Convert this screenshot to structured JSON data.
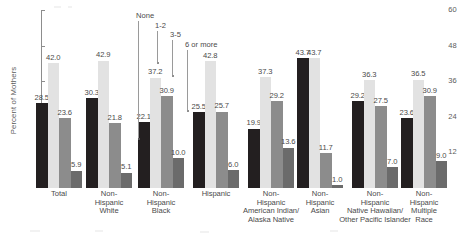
{
  "chart_data": {
    "type": "bar",
    "title": "",
    "xlabel": "",
    "ylabel": "Percent of Mothers",
    "ylim": [
      0,
      60
    ],
    "yticks": [
      12,
      24,
      36,
      48,
      60
    ],
    "grid": false,
    "legend_position": "inside-top-left-callouts",
    "categories": [
      "Total",
      "Non-Hispanic White",
      "Non-Hispanic Black",
      "Hispanic",
      "Non-Hispanic American Indian/ Alaska Native",
      "Non-Hispanic Asian",
      "Non-Hispanic Native Hawaiian/ Other Pacific Islander",
      "Non-Hispanic Multiple Race"
    ],
    "category_lines": [
      [
        "Total"
      ],
      [
        "Non-",
        "Hispanic",
        "White"
      ],
      [
        "Non-",
        "Hispanic",
        "Black"
      ],
      [
        "Hispanic"
      ],
      [
        "Non-",
        "Hispanic",
        "American Indian/",
        "Alaska Native"
      ],
      [
        "Non-",
        "Hispanic",
        "Asian"
      ],
      [
        "Non-",
        "Hispanic",
        "Native Hawaiian/",
        "Other Pacific Islander"
      ],
      [
        "Non-",
        "Hispanic",
        "Multiple",
        "Race"
      ]
    ],
    "series": [
      {
        "name": "None",
        "color": "#231f20",
        "values": [
          28.5,
          30.3,
          22.1,
          25.5,
          19.9,
          43.7,
          29.2,
          23.6
        ]
      },
      {
        "name": "1-2",
        "color": "#e2e2e2",
        "values": [
          42.0,
          42.9,
          37.2,
          42.8,
          37.3,
          43.7,
          36.3,
          36.5
        ]
      },
      {
        "name": "3-5",
        "color": "#8c8c8c",
        "values": [
          23.6,
          21.8,
          30.9,
          25.7,
          29.2,
          11.7,
          27.5,
          30.9
        ]
      },
      {
        "name": "6 or more",
        "color": "#6b6b6b",
        "values": [
          5.9,
          5.1,
          10.0,
          6.0,
          13.6,
          1.0,
          7.0,
          9.0
        ]
      }
    ]
  },
  "legend": {
    "items": [
      {
        "label": "None"
      },
      {
        "label": "1-2"
      },
      {
        "label": "3-5"
      },
      {
        "label": "6 or more"
      }
    ]
  }
}
